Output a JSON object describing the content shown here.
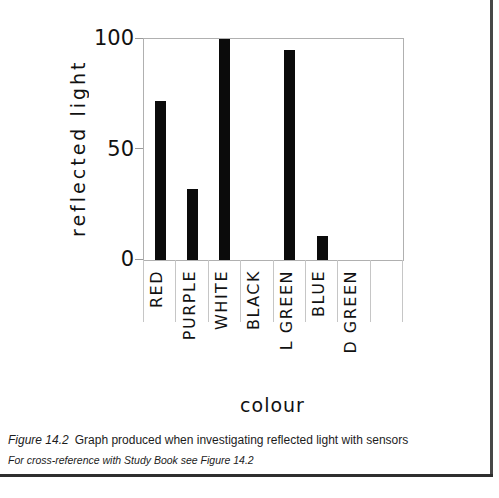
{
  "page": {
    "caption_figure": "Figure 14.2",
    "caption_text": "Graph produced when investigating reflected light with sensors",
    "cross_reference": "For cross-reference with Study Book see Figure 14.2"
  },
  "chart_data": {
    "type": "bar",
    "title": "",
    "xlabel": "colour",
    "ylabel": "reflected light",
    "categories": [
      "RED",
      "PURPLE",
      "WHITE",
      "BLACK",
      "L GREEN",
      "BLUE",
      "D GREEN"
    ],
    "values": [
      72,
      32,
      100,
      0,
      95,
      11,
      0
    ],
    "ylim": [
      0,
      100
    ],
    "yticks": [
      0,
      50,
      100
    ],
    "grid": false,
    "legend": false,
    "layout": {
      "trailing_empty_slots": 1,
      "plot": {
        "left": 143,
        "top": 38,
        "width": 259,
        "height": 221
      },
      "bar_width": 11,
      "separator_length": 62,
      "label_gap": 11
    },
    "colors": {
      "bar": "#0b0b0b",
      "plot_border": "#b0b0b0",
      "separator": "#c6c6c6",
      "tick": "#9a9a9a",
      "page_edge": "#474747",
      "page_rule": "#2e2e2e"
    }
  },
  "page_chrome": {
    "edge_x": 490,
    "edge_height": 476,
    "rule_y": 474,
    "rule_width": 493
  }
}
